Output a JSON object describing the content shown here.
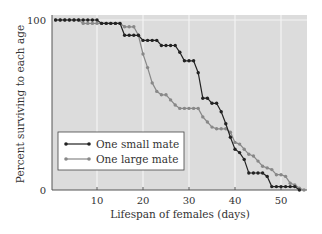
{
  "chart_data": {
    "type": "line",
    "title": "",
    "xlabel": "Lifespan of females (days)",
    "ylabel": "Percent surviving to each age",
    "xlim": [
      0,
      56
    ],
    "ylim": [
      0,
      100
    ],
    "xticks": [
      10,
      20,
      30,
      40,
      50
    ],
    "yticks": [
      0,
      100
    ],
    "grid": "vertical white lines at x ticks, horizontal line at 100",
    "legend_position": "lower left inside plot",
    "colors": {
      "background": "#dcdcdc",
      "grid": "#f4f4f4",
      "small_mate": "#222222",
      "large_mate": "#888888"
    },
    "series": [
      {
        "name": "One small mate",
        "x": [
          1,
          2,
          3,
          4,
          5,
          6,
          7,
          8,
          9,
          10,
          11,
          12,
          13,
          14,
          15,
          16,
          17,
          18,
          19,
          20,
          21,
          22,
          23,
          24,
          25,
          26,
          27,
          28,
          29,
          30,
          31,
          32,
          33,
          34,
          35,
          36,
          37,
          38,
          39,
          40,
          41,
          42,
          43,
          44,
          45,
          46,
          47,
          48,
          49,
          50,
          51,
          52,
          53,
          54
        ],
        "y": [
          100,
          100,
          100,
          100,
          100,
          100,
          100,
          100,
          100,
          100,
          98,
          98,
          98,
          98,
          98,
          91,
          91,
          91,
          91,
          88,
          88,
          88,
          88,
          85,
          85,
          85,
          85,
          81,
          76,
          76,
          76,
          69,
          54,
          54,
          51,
          51,
          46,
          39,
          31,
          24,
          22,
          18,
          10,
          10,
          10,
          10,
          8,
          2,
          2,
          2,
          2,
          2,
          2,
          0
        ]
      },
      {
        "name": "One large mate",
        "x": [
          1,
          2,
          3,
          4,
          5,
          6,
          7,
          8,
          9,
          10,
          11,
          12,
          13,
          14,
          15,
          16,
          17,
          18,
          19,
          20,
          21,
          22,
          23,
          24,
          25,
          26,
          27,
          28,
          29,
          30,
          31,
          32,
          33,
          34,
          35,
          36,
          37,
          38,
          39,
          40,
          41,
          42,
          43,
          44,
          45,
          46,
          47,
          48,
          49,
          50,
          51,
          52,
          53,
          54,
          55
        ],
        "y": [
          100,
          100,
          100,
          100,
          100,
          100,
          98,
          98,
          98,
          98,
          98,
          98,
          98,
          98,
          98,
          96,
          96,
          96,
          91,
          80,
          72,
          63,
          58,
          56,
          56,
          53,
          50,
          48,
          48,
          48,
          48,
          48,
          43,
          40,
          37,
          36,
          36,
          36,
          34,
          28,
          27,
          24,
          21,
          20,
          17,
          14,
          13,
          12,
          9,
          9,
          8,
          4,
          3,
          1,
          0
        ]
      }
    ]
  },
  "plot": {
    "y_tick_labels": [
      "100",
      "0"
    ],
    "x_tick_labels": [
      "10",
      "20",
      "30",
      "40",
      "50"
    ]
  },
  "legend": {
    "items": [
      "One small mate",
      "One large mate"
    ]
  }
}
